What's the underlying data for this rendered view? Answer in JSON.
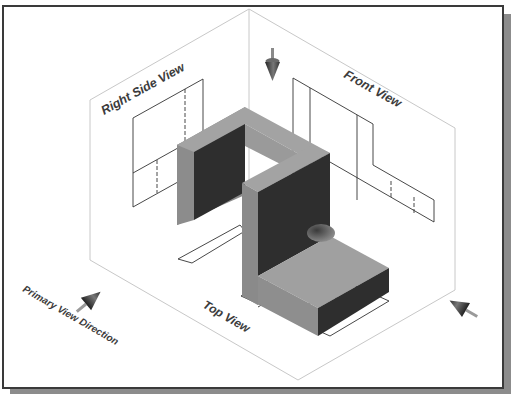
{
  "figure": {
    "labels": {
      "right_side_view": "Right Side View",
      "front_view": "Front View",
      "top_view": "Top View",
      "primary_view_direction": "Primary View Direction"
    },
    "arrows": [
      {
        "name": "top-view-direction-arrow",
        "direction": "down"
      },
      {
        "name": "primary-view-direction-arrow",
        "direction": "up-right"
      },
      {
        "name": "right-side-view-direction-arrow",
        "direction": "up-left"
      }
    ],
    "colors": {
      "frame_border": "#3a3a3a",
      "frame_shadow": "#8c8c8c",
      "box_edges": "#c8c8c8",
      "projection_lines": "#333333",
      "object_top": "#a0a0a0",
      "object_left": "#8a8a8a",
      "object_dark": "#2e2e2e",
      "label_text": "#3c3c3c"
    }
  }
}
